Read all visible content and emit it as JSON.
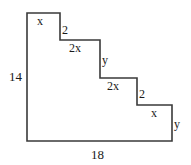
{
  "figure": {
    "shape_name": "staircase-polygon",
    "stroke_color": "#3a3a3a",
    "fill_color": "#ffffff",
    "text_color": "#1a1a1a",
    "background": "#ffffff",
    "outline_points": "27,13 60,13 60,40 100,40 100,78 137,78 137,105 172,105 172,141 27,141",
    "labels": {
      "top_step_x": "x",
      "first_riser_2": "2",
      "second_tread_2x": "2x",
      "second_riser_y": "y",
      "third_tread_2x": "2x",
      "third_riser_2": "2",
      "fourth_tread_x": "x",
      "fourth_riser_y": "y",
      "left_height_14": "14",
      "bottom_width_18": "18"
    }
  }
}
